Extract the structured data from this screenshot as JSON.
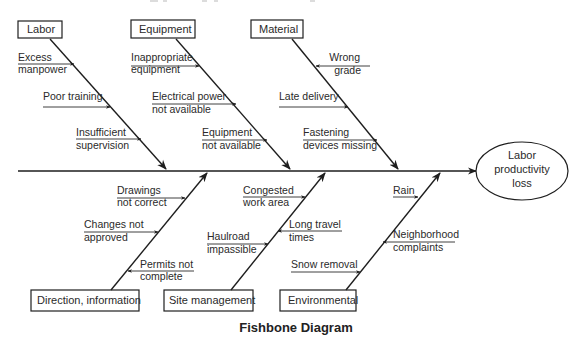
{
  "figure": {
    "title": "Fishbone Diagram",
    "effect": {
      "lines": [
        "Labor",
        "productivity",
        "loss"
      ]
    }
  },
  "categories": {
    "top": [
      {
        "label": "Labor",
        "causes": [
          {
            "lines": [
              "Excess",
              "manpower"
            ]
          },
          {
            "lines": [
              "Poor training"
            ]
          },
          {
            "lines": [
              "Insufficient",
              "supervision"
            ]
          }
        ]
      },
      {
        "label": "Equipment",
        "causes": [
          {
            "lines": [
              "Inappropriate",
              "equipment"
            ]
          },
          {
            "lines": [
              "Electrical power",
              "not available"
            ]
          },
          {
            "lines": [
              "Equipment",
              "not available"
            ]
          }
        ]
      },
      {
        "label": "Material",
        "causes": [
          {
            "lines": [
              "Wrong",
              "grade"
            ]
          },
          {
            "lines": [
              "Late delivery"
            ]
          },
          {
            "lines": [
              "Fastening",
              "devices missing"
            ]
          }
        ]
      }
    ],
    "bottom": [
      {
        "label": "Direction, information",
        "causes": [
          {
            "lines": [
              "Drawings",
              "not correct"
            ]
          },
          {
            "lines": [
              "Changes not",
              "approved"
            ]
          },
          {
            "lines": [
              "Permits not",
              "complete"
            ]
          }
        ]
      },
      {
        "label": "Site management",
        "causes": [
          {
            "lines": [
              "Congested",
              "work area"
            ]
          },
          {
            "lines": [
              "Long travel",
              "times"
            ]
          },
          {
            "lines": [
              "Haulroad",
              "impassible"
            ]
          }
        ]
      },
      {
        "label": "Environmental",
        "causes": [
          {
            "lines": [
              "Rain"
            ]
          },
          {
            "lines": [
              "Neighborhood",
              "complaints"
            ]
          },
          {
            "lines": [
              "Snow removal"
            ]
          }
        ]
      }
    ]
  },
  "colors": {
    "line": "#1e1e1e",
    "text": "#2a2a2a",
    "background": "#ffffff"
  }
}
